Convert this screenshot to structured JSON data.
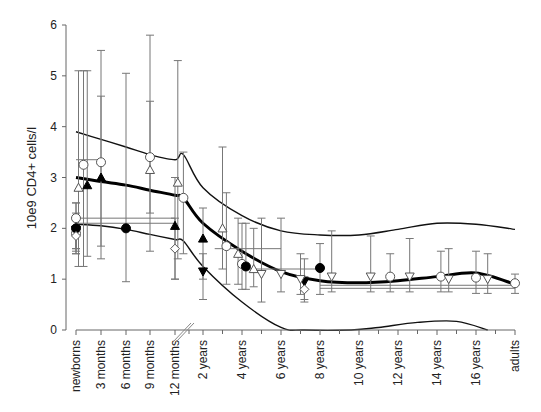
{
  "chart_data": {
    "type": "scatter",
    "title": "",
    "xlabel": "",
    "ylabel": "10e9 CD4+ cells/l",
    "ylim": [
      0,
      6
    ],
    "yticks": [
      "0",
      "1",
      "2",
      "3",
      "4",
      "5",
      "6"
    ],
    "x_categories": [
      "newborns",
      "3 months",
      "6 months",
      "9 months",
      "12 months",
      "2 years",
      "4 years",
      "6 years",
      "8 years",
      "10 years",
      "12 years",
      "14 years",
      "16 years",
      "adults"
    ],
    "x_axis_break": "between 12 months and 2 years",
    "grid": false,
    "reference_curves": {
      "mean": {
        "name": "mean (thick)",
        "x": [
          0,
          1,
          2,
          3,
          4,
          4.3,
          5,
          6,
          7,
          8,
          9,
          10,
          11,
          12,
          13
        ],
        "y": [
          3.0,
          2.92,
          2.85,
          2.75,
          2.65,
          2.6,
          2.1,
          1.55,
          1.15,
          0.97,
          0.93,
          0.97,
          1.05,
          1.12,
          0.9
        ]
      },
      "upper": {
        "name": "upper limit",
        "x": [
          0,
          1,
          2,
          3,
          4,
          4.3,
          5,
          6,
          7,
          8,
          9,
          10,
          11,
          12,
          13
        ],
        "y": [
          3.9,
          3.75,
          3.6,
          3.45,
          3.35,
          3.45,
          2.8,
          2.25,
          1.95,
          1.87,
          1.87,
          1.98,
          2.1,
          2.08,
          1.98
        ]
      },
      "lower": {
        "name": "lower limit",
        "x": [
          0,
          1,
          2,
          3,
          4,
          4.3,
          5,
          6,
          7,
          7.6,
          8.8,
          9.5,
          10.5,
          11.5,
          12.3
        ],
        "y": [
          2.08,
          2.05,
          1.98,
          1.88,
          1.78,
          1.75,
          1.25,
          0.55,
          0.05,
          0.0,
          0.0,
          0.05,
          0.15,
          0.17,
          0.0
        ]
      }
    },
    "series": [
      {
        "name": "study A",
        "marker": "open-circle",
        "points": [
          {
            "x": 0.0,
            "y": 2.2,
            "lo": 1.5,
            "hi": 2.5
          },
          {
            "x": 0.0,
            "y": 1.9,
            "lo": 1.6,
            "hi": 2.2
          },
          {
            "x": 0.3,
            "y": 3.25,
            "lo": 1.25,
            "hi": 5.1
          },
          {
            "x": 1.0,
            "y": 3.3,
            "lo": 1.4,
            "hi": 5.5
          },
          {
            "x": 3.0,
            "y": 3.4,
            "lo": 2.3,
            "hi": 4.5
          },
          {
            "x": 4.3,
            "y": 2.6,
            "lo": 1.5,
            "hi": 3.5
          },
          {
            "x": 5.6,
            "y": 1.65,
            "lo": 0.9,
            "hi": 2.7
          },
          {
            "x": 6.0,
            "y": 1.3,
            "lo": 0.8,
            "hi": 2.1
          },
          {
            "x": 9.8,
            "y": 1.05,
            "lo": 0.75,
            "hi": 1.5
          },
          {
            "x": 11.1,
            "y": 1.05,
            "lo": 0.75,
            "hi": 1.55
          },
          {
            "x": 12.0,
            "y": 1.03,
            "lo": 0.72,
            "hi": 1.55
          },
          {
            "x": 13.0,
            "y": 0.92,
            "lo": 0.72,
            "hi": 1.1
          }
        ]
      },
      {
        "name": "study B",
        "marker": "open-triangle-up",
        "points": [
          {
            "x": 0.1,
            "y": 2.8,
            "lo": 1.25,
            "hi": 5.1
          },
          {
            "x": 3.0,
            "y": 3.15,
            "lo": 1.55,
            "hi": 5.8
          },
          {
            "x": 4.1,
            "y": 2.9,
            "lo": 1.4,
            "hi": 5.3
          },
          {
            "x": 5.5,
            "y": 2.0,
            "lo": 1.2,
            "hi": 3.6
          },
          {
            "x": 5.9,
            "y": 1.5,
            "lo": 0.9,
            "hi": 2.2
          },
          {
            "x": 6.3,
            "y": 1.2,
            "lo": 0.85,
            "hi": 2.0
          }
        ]
      },
      {
        "name": "study C",
        "marker": "filled-triangle-up",
        "points": [
          {
            "x": 0.45,
            "y": 2.85,
            "lo": 1.45,
            "hi": 5.1
          },
          {
            "x": 1.0,
            "y": 3.0,
            "lo": 1.65,
            "hi": 4.6
          },
          {
            "x": 4.0,
            "y": 2.05,
            "lo": 1.0,
            "hi": 3.0
          },
          {
            "x": 5.0,
            "y": 1.8,
            "lo": 1.0,
            "hi": 2.4
          }
        ]
      },
      {
        "name": "study D",
        "marker": "filled-circle",
        "points": [
          {
            "x": 0.0,
            "y": 2.0,
            "lo": 1.5,
            "hi": 2.5
          },
          {
            "x": 2.0,
            "y": 2.0,
            "lo": 0.95,
            "hi": 5.05
          },
          {
            "x": 6.1,
            "y": 1.25,
            "lo": 0.8,
            "hi": 2.1
          },
          {
            "x": 8.0,
            "y": 1.22,
            "lo": 0.7,
            "hi": 1.7
          }
        ]
      },
      {
        "name": "study E",
        "marker": "filled-triangle-down",
        "points": [
          {
            "x": 0.0,
            "y": 1.97,
            "lo": 1.6,
            "hi": 2.3
          },
          {
            "x": 5.0,
            "y": 1.15,
            "lo": 0.6,
            "hi": 1.5
          },
          {
            "x": 7.6,
            "y": 0.95,
            "lo": 0.6,
            "hi": 1.4
          }
        ]
      },
      {
        "name": "study F",
        "marker": "open-triangle-down",
        "points": [
          {
            "x": 6.5,
            "y": 1.1,
            "lo": 0.55,
            "hi": 2.2
          },
          {
            "x": 7.0,
            "y": 1.1,
            "lo": 0.75,
            "hi": 2.2
          },
          {
            "x": 7.5,
            "y": 1.0,
            "lo": 0.7,
            "hi": 1.5
          },
          {
            "x": 8.3,
            "y": 1.05,
            "lo": 0.75,
            "hi": 1.95
          },
          {
            "x": 9.3,
            "y": 1.05,
            "lo": 0.75,
            "hi": 1.85
          },
          {
            "x": 10.3,
            "y": 1.05,
            "lo": 0.75,
            "hi": 1.8
          },
          {
            "x": 11.3,
            "y": 1.0,
            "lo": 0.75,
            "hi": 1.6
          },
          {
            "x": 12.3,
            "y": 1.0,
            "lo": 0.72,
            "hi": 1.5
          }
        ]
      },
      {
        "name": "study G",
        "marker": "open-diamond",
        "points": [
          {
            "x": 0.0,
            "y": 1.85,
            "lo": 1.55,
            "hi": 2.15
          },
          {
            "x": 4.0,
            "y": 1.6,
            "lo": 1.0,
            "hi": 2.2
          },
          {
            "x": 7.6,
            "y": 0.8,
            "lo": 0.55,
            "hi": 1.05
          }
        ]
      }
    ],
    "horizontal_ranges": [
      {
        "y": 3.35,
        "x0": 0.0,
        "x1": 1.0
      },
      {
        "y": 2.2,
        "x0": 0.0,
        "x1": 4.0
      },
      {
        "y": 2.1,
        "x0": 0.0,
        "x1": 4.0
      },
      {
        "y": 1.6,
        "x0": 5.3,
        "x1": 7.0
      },
      {
        "y": 1.2,
        "x0": 6.0,
        "x1": 8.0
      },
      {
        "y": 0.88,
        "x0": 8.0,
        "x1": 13.0
      },
      {
        "y": 0.82,
        "x0": 8.0,
        "x1": 13.0
      }
    ]
  }
}
